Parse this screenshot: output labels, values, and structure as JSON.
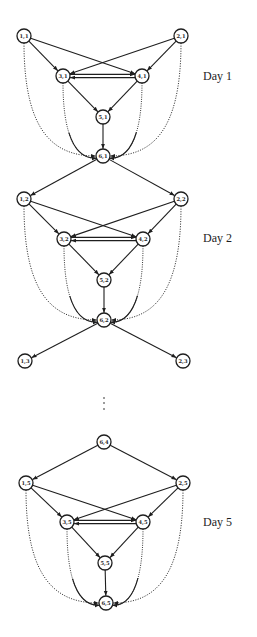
{
  "diagram": {
    "node_radius": 7,
    "stroke_color": "#1e1e1e",
    "background": "#ffffff",
    "day_labels": [
      {
        "text": "Day 1",
        "x": 203,
        "y": 70
      },
      {
        "text": "Day 2",
        "x": 203,
        "y": 232
      },
      {
        "text": "Day 5",
        "x": 203,
        "y": 516
      }
    ],
    "ellipsis": {
      "x": 104,
      "dots_y": [
        398,
        403,
        409
      ]
    },
    "nodes": [
      {
        "id": "1,1",
        "label": "1,1",
        "x": 24,
        "y": 36
      },
      {
        "id": "2,1",
        "label": "2,1",
        "x": 181,
        "y": 36
      },
      {
        "id": "3,1",
        "label": "3,1",
        "x": 63,
        "y": 76
      },
      {
        "id": "4,1",
        "label": "4,1",
        "x": 142,
        "y": 76
      },
      {
        "id": "5,1",
        "label": "5,1",
        "x": 103,
        "y": 117
      },
      {
        "id": "6,1",
        "label": "6,1",
        "x": 103,
        "y": 156
      },
      {
        "id": "1,2",
        "label": "1,2",
        "x": 24,
        "y": 199
      },
      {
        "id": "2,2",
        "label": "2,2",
        "x": 181,
        "y": 199
      },
      {
        "id": "3,2",
        "label": "3,2",
        "x": 64,
        "y": 239
      },
      {
        "id": "4,2",
        "label": "4,2",
        "x": 143,
        "y": 239
      },
      {
        "id": "5,2",
        "label": "5,2",
        "x": 104,
        "y": 280
      },
      {
        "id": "6,2",
        "label": "6,2",
        "x": 104,
        "y": 320
      },
      {
        "id": "1,3",
        "label": "1,3",
        "x": 25,
        "y": 361
      },
      {
        "id": "2,3",
        "label": "2,3",
        "x": 183,
        "y": 361
      },
      {
        "id": "6,4",
        "label": "6,4",
        "x": 104,
        "y": 442
      },
      {
        "id": "1,5",
        "label": "1,5",
        "x": 26,
        "y": 483
      },
      {
        "id": "2,5",
        "label": "2,5",
        "x": 183,
        "y": 483
      },
      {
        "id": "3,5",
        "label": "3,5",
        "x": 67,
        "y": 522
      },
      {
        "id": "4,5",
        "label": "4,5",
        "x": 143,
        "y": 522
      },
      {
        "id": "5,5",
        "label": "5,5",
        "x": 105,
        "y": 563
      },
      {
        "id": "6,5",
        "label": "6,5",
        "x": 106,
        "y": 603
      }
    ],
    "edges": [
      {
        "from": "1,1",
        "to": "3,1"
      },
      {
        "from": "1,1",
        "to": "4,1"
      },
      {
        "from": "2,1",
        "to": "3,1"
      },
      {
        "from": "2,1",
        "to": "4,1"
      },
      {
        "from": "3,1",
        "to": "4,1",
        "dy": -1.6
      },
      {
        "from": "4,1",
        "to": "3,1",
        "dy": 1.6
      },
      {
        "from": "3,1",
        "to": "5,1"
      },
      {
        "from": "4,1",
        "to": "5,1"
      },
      {
        "from": "5,1",
        "to": "6,1"
      },
      {
        "from": "6,1",
        "to": "1,2"
      },
      {
        "from": "6,1",
        "to": "2,2"
      },
      {
        "from": "1,2",
        "to": "3,2"
      },
      {
        "from": "1,2",
        "to": "4,2"
      },
      {
        "from": "2,2",
        "to": "3,2"
      },
      {
        "from": "2,2",
        "to": "4,2"
      },
      {
        "from": "3,2",
        "to": "4,2",
        "dy": -1.6
      },
      {
        "from": "4,2",
        "to": "3,2",
        "dy": 1.6
      },
      {
        "from": "3,2",
        "to": "5,2"
      },
      {
        "from": "4,2",
        "to": "5,2"
      },
      {
        "from": "5,2",
        "to": "6,2"
      },
      {
        "from": "6,2",
        "to": "1,3"
      },
      {
        "from": "6,2",
        "to": "2,3"
      },
      {
        "from": "6,4",
        "to": "1,5"
      },
      {
        "from": "6,4",
        "to": "2,5"
      },
      {
        "from": "1,5",
        "to": "3,5"
      },
      {
        "from": "1,5",
        "to": "4,5"
      },
      {
        "from": "2,5",
        "to": "3,5"
      },
      {
        "from": "2,5",
        "to": "4,5"
      },
      {
        "from": "3,5",
        "to": "4,5",
        "dy": -1.6
      },
      {
        "from": "4,5",
        "to": "3,5",
        "dy": 1.6
      },
      {
        "from": "3,5",
        "to": "5,5"
      },
      {
        "from": "4,5",
        "to": "5,5"
      },
      {
        "from": "5,5",
        "to": "6,5"
      }
    ],
    "curves": [
      {
        "from": "1,1",
        "to": "6,1",
        "kind": "outer",
        "side": "left",
        "style": "dotted"
      },
      {
        "from": "2,1",
        "to": "6,1",
        "kind": "outer",
        "side": "right",
        "style": "dotted"
      },
      {
        "from": "3,1",
        "to": "6,1",
        "kind": "inner",
        "side": "left",
        "style": "dotted-solid"
      },
      {
        "from": "4,1",
        "to": "6,1",
        "kind": "inner",
        "side": "right",
        "style": "dotted-solid"
      },
      {
        "from": "1,2",
        "to": "6,2",
        "kind": "outer",
        "side": "left",
        "style": "dotted"
      },
      {
        "from": "2,2",
        "to": "6,2",
        "kind": "outer",
        "side": "right",
        "style": "dotted"
      },
      {
        "from": "3,2",
        "to": "6,2",
        "kind": "inner",
        "side": "left",
        "style": "dotted-solid"
      },
      {
        "from": "4,2",
        "to": "6,2",
        "kind": "inner",
        "side": "right",
        "style": "dotted-solid"
      },
      {
        "from": "1,5",
        "to": "6,5",
        "kind": "outer",
        "side": "left",
        "style": "dotted"
      },
      {
        "from": "2,5",
        "to": "6,5",
        "kind": "outer",
        "side": "right",
        "style": "dotted"
      },
      {
        "from": "3,5",
        "to": "6,5",
        "kind": "inner",
        "side": "left",
        "style": "dotted-solid"
      },
      {
        "from": "4,5",
        "to": "6,5",
        "kind": "inner",
        "side": "right",
        "style": "dotted-solid"
      }
    ]
  }
}
